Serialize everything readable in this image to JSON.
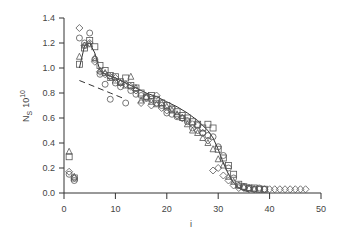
{
  "chart_data": {
    "type": "scatter",
    "title": "",
    "xlabel": "i",
    "ylabel": "N_S 10^10",
    "ylabel_main": "N",
    "ylabel_sub": "S",
    "ylabel_exp": "10",
    "ylabel_base": "10",
    "xlim": [
      0,
      50
    ],
    "ylim": [
      0.0,
      1.4
    ],
    "xticks": [
      0,
      10,
      20,
      30,
      40,
      50
    ],
    "xtick_labels": [
      "0",
      "10",
      "20",
      "30",
      "40",
      "50"
    ],
    "yticks": [
      0.0,
      0.2,
      0.4,
      0.6,
      0.8,
      1.0,
      1.2,
      1.4
    ],
    "ytick_labels": [
      "0.0",
      "0.2",
      "0.4",
      "0.6",
      "0.8",
      "1.0",
      "1.2",
      "1.4"
    ],
    "grid": false,
    "legend": "none",
    "series": [
      {
        "name": "diamonds",
        "marker": "diamond",
        "points": [
          [
            1,
            0.17
          ],
          [
            2,
            0.12
          ],
          [
            3,
            1.32
          ],
          [
            4,
            1.18
          ],
          [
            5,
            1.2
          ],
          [
            6,
            1.05
          ],
          [
            7,
            0.97
          ],
          [
            8,
            0.95
          ],
          [
            9,
            0.93
          ],
          [
            10,
            0.92
          ],
          [
            11,
            0.88
          ],
          [
            12,
            0.87
          ],
          [
            13,
            0.85
          ],
          [
            14,
            0.82
          ],
          [
            15,
            0.72
          ],
          [
            16,
            0.76
          ],
          [
            17,
            0.7
          ],
          [
            18,
            0.78
          ],
          [
            19,
            0.68
          ],
          [
            20,
            0.66
          ],
          [
            21,
            0.68
          ],
          [
            22,
            0.62
          ],
          [
            23,
            0.6
          ],
          [
            24,
            0.58
          ],
          [
            25,
            0.55
          ],
          [
            26,
            0.5
          ],
          [
            27,
            0.48
          ],
          [
            28,
            0.42
          ],
          [
            29,
            0.18
          ],
          [
            30,
            0.2
          ],
          [
            31,
            0.14
          ],
          [
            32,
            0.1
          ],
          [
            33,
            0.06
          ],
          [
            34,
            0.04
          ],
          [
            35,
            0.04
          ],
          [
            36,
            0.03
          ],
          [
            37,
            0.03
          ],
          [
            38,
            0.03
          ],
          [
            39,
            0.03
          ],
          [
            40,
            0.03
          ],
          [
            41,
            0.03
          ],
          [
            42,
            0.03
          ],
          [
            43,
            0.03
          ],
          [
            44,
            0.03
          ],
          [
            45,
            0.03
          ],
          [
            46,
            0.03
          ],
          [
            47,
            0.03
          ]
        ]
      },
      {
        "name": "circles",
        "marker": "circle",
        "points": [
          [
            1,
            0.15
          ],
          [
            2,
            0.1
          ],
          [
            3,
            1.24
          ],
          [
            4,
            1.2
          ],
          [
            5,
            1.28
          ],
          [
            6,
            1.07
          ],
          [
            7,
            0.95
          ],
          [
            8,
            0.87
          ],
          [
            9,
            0.75
          ],
          [
            10,
            0.88
          ],
          [
            11,
            0.85
          ],
          [
            12,
            0.72
          ],
          [
            13,
            0.82
          ],
          [
            14,
            0.79
          ],
          [
            15,
            0.78
          ],
          [
            16,
            0.77
          ],
          [
            17,
            0.75
          ],
          [
            18,
            0.72
          ],
          [
            19,
            0.7
          ],
          [
            20,
            0.64
          ],
          [
            21,
            0.63
          ],
          [
            22,
            0.61
          ],
          [
            23,
            0.6
          ],
          [
            24,
            0.57
          ],
          [
            25,
            0.52
          ],
          [
            26,
            0.54
          ],
          [
            27,
            0.48
          ],
          [
            28,
            0.46
          ],
          [
            29,
            0.45
          ],
          [
            30,
            0.37
          ],
          [
            31,
            0.3
          ],
          [
            32,
            0.2
          ],
          [
            33,
            0.12
          ],
          [
            34,
            0.06
          ],
          [
            35,
            0.05
          ],
          [
            36,
            0.04
          ],
          [
            37,
            0.03
          ],
          [
            38,
            0.04
          ],
          [
            39,
            0.03
          ]
        ]
      },
      {
        "name": "squares",
        "marker": "square",
        "points": [
          [
            1,
            0.29
          ],
          [
            2,
            0.12
          ],
          [
            3,
            1.03
          ],
          [
            4,
            1.16
          ],
          [
            5,
            1.22
          ],
          [
            6,
            1.17
          ],
          [
            7,
            1.02
          ],
          [
            8,
            0.98
          ],
          [
            9,
            0.94
          ],
          [
            10,
            0.93
          ],
          [
            11,
            0.89
          ],
          [
            12,
            0.92
          ],
          [
            13,
            0.86
          ],
          [
            14,
            0.84
          ],
          [
            15,
            0.8
          ],
          [
            16,
            0.76
          ],
          [
            17,
            0.78
          ],
          [
            18,
            0.75
          ],
          [
            19,
            0.72
          ],
          [
            20,
            0.7
          ],
          [
            21,
            0.67
          ],
          [
            22,
            0.65
          ],
          [
            23,
            0.62
          ],
          [
            24,
            0.6
          ],
          [
            25,
            0.57
          ],
          [
            26,
            0.55
          ],
          [
            27,
            0.52
          ],
          [
            28,
            0.55
          ],
          [
            29,
            0.52
          ],
          [
            30,
            0.35
          ],
          [
            31,
            0.28
          ],
          [
            32,
            0.22
          ],
          [
            33,
            0.15
          ],
          [
            34,
            0.07
          ],
          [
            35,
            0.05
          ],
          [
            36,
            0.04
          ],
          [
            37,
            0.04
          ],
          [
            38,
            0.03
          ],
          [
            39,
            0.03
          ]
        ]
      },
      {
        "name": "triangles",
        "marker": "triangle",
        "points": [
          [
            1,
            0.33
          ],
          [
            2,
            0.13
          ],
          [
            3,
            1.09
          ],
          [
            4,
            1.18
          ],
          [
            5,
            1.19
          ],
          [
            6,
            1.08
          ],
          [
            7,
            0.98
          ],
          [
            8,
            0.96
          ],
          [
            9,
            0.92
          ],
          [
            10,
            0.9
          ],
          [
            11,
            0.88
          ],
          [
            12,
            0.86
          ],
          [
            13,
            0.93
          ],
          [
            14,
            0.84
          ],
          [
            15,
            0.74
          ],
          [
            16,
            0.77
          ],
          [
            17,
            0.73
          ],
          [
            18,
            0.71
          ],
          [
            19,
            0.72
          ],
          [
            20,
            0.69
          ],
          [
            21,
            0.66
          ],
          [
            22,
            0.63
          ],
          [
            23,
            0.6
          ],
          [
            24,
            0.55
          ],
          [
            25,
            0.5
          ],
          [
            26,
            0.48
          ],
          [
            27,
            0.44
          ],
          [
            28,
            0.4
          ],
          [
            29,
            0.35
          ],
          [
            30,
            0.27
          ],
          [
            31,
            0.22
          ],
          [
            32,
            0.13
          ],
          [
            33,
            0.09
          ],
          [
            34,
            0.06
          ],
          [
            35,
            0.05
          ],
          [
            36,
            0.04
          ],
          [
            37,
            0.03
          ]
        ]
      }
    ],
    "lines": [
      {
        "name": "solid-fit",
        "style": "solid",
        "points": [
          [
            3,
            1.0
          ],
          [
            4,
            1.18
          ],
          [
            5,
            1.2
          ],
          [
            6,
            1.12
          ],
          [
            7,
            0.98
          ],
          [
            8,
            0.95
          ],
          [
            10,
            0.92
          ],
          [
            12,
            0.88
          ],
          [
            14,
            0.84
          ],
          [
            16,
            0.8
          ],
          [
            18,
            0.77
          ],
          [
            20,
            0.73
          ],
          [
            22,
            0.69
          ],
          [
            24,
            0.64
          ],
          [
            26,
            0.58
          ],
          [
            28,
            0.5
          ],
          [
            29,
            0.44
          ],
          [
            30,
            0.35
          ],
          [
            31,
            0.24
          ],
          [
            32,
            0.15
          ],
          [
            33,
            0.08
          ],
          [
            34,
            0.04
          ],
          [
            35,
            0.02
          ],
          [
            36,
            0.01
          ]
        ]
      },
      {
        "name": "dashed-fit",
        "style": "dashed",
        "points": [
          [
            3,
            0.9
          ],
          [
            6,
            0.85
          ],
          [
            9,
            0.8
          ],
          [
            12,
            0.75
          ]
        ]
      }
    ]
  }
}
